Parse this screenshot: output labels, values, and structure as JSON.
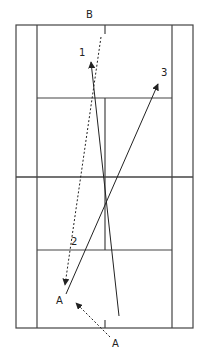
{
  "diagram": {
    "type": "tennis-court-drill",
    "labels": {
      "top_player": "B",
      "shot_1": "1",
      "shot_2": "2",
      "shot_3": "3",
      "player_a_net": "A",
      "player_a_start": "A"
    },
    "colors": {
      "lines": "#444444",
      "arrows": "#222222",
      "background": "#ffffff"
    },
    "shots": [
      {
        "id": "1",
        "style": "solid",
        "from": [
          119,
          316
        ],
        "to": [
          91,
          62
        ]
      },
      {
        "id": "2",
        "style": "dashed",
        "from": [
          101,
          37
        ],
        "to": [
          65,
          285
        ]
      },
      {
        "id": "3",
        "style": "solid",
        "from": [
          66,
          294
        ],
        "to": [
          158,
          84
        ]
      },
      {
        "id": "A-move",
        "style": "dashed",
        "from": [
          110,
          337
        ],
        "to": [
          76,
          303
        ]
      }
    ]
  }
}
